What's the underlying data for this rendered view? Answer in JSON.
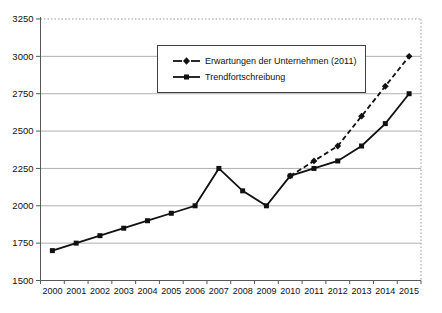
{
  "chart_data": {
    "type": "line",
    "title": "",
    "xlabel": "",
    "ylabel": "",
    "x": [
      2000,
      2001,
      2002,
      2003,
      2004,
      2005,
      2006,
      2007,
      2008,
      2009,
      2010,
      2011,
      2012,
      2013,
      2014,
      2015
    ],
    "ylim": [
      1500,
      3250
    ],
    "ytick_step": 250,
    "yticks": [
      1500,
      1750,
      2000,
      2250,
      2500,
      2750,
      3000,
      3250
    ],
    "grid": true,
    "legend_position": "inside-top-center",
    "series": [
      {
        "name": "Erwartungen der Unternehmen (2011)",
        "line_style": "dashed",
        "marker": "diamond",
        "color": "#111111",
        "values": [
          null,
          null,
          null,
          null,
          null,
          null,
          null,
          null,
          null,
          null,
          2200,
          2300,
          2400,
          2600,
          2800,
          3000
        ]
      },
      {
        "name": "Trendfortschreibung",
        "line_style": "solid",
        "marker": "square",
        "color": "#111111",
        "values": [
          1700,
          1750,
          1800,
          1850,
          1900,
          1950,
          2000,
          2250,
          2100,
          2000,
          2200,
          2250,
          2300,
          2400,
          2550,
          2750
        ]
      }
    ],
    "colors": {
      "background": "#ffffff",
      "grid": "#b0b0b0",
      "plot_border_dotted": "#9a9a9a",
      "axis": "#595959",
      "text": "#111111"
    }
  }
}
